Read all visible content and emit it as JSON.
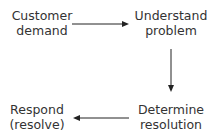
{
  "diagram": {
    "type": "flow-cycle",
    "nodes": [
      {
        "id": "customer-demand",
        "lines": [
          "Customer",
          "demand"
        ]
      },
      {
        "id": "understand-problem",
        "lines": [
          "Understand",
          "problem"
        ]
      },
      {
        "id": "determine-resolution",
        "lines": [
          "Determine",
          "resolution"
        ]
      },
      {
        "id": "respond-resolve",
        "lines": [
          "Respond",
          "(resolve)"
        ]
      }
    ],
    "edges": [
      {
        "from": "customer-demand",
        "to": "understand-problem",
        "direction": "right"
      },
      {
        "from": "understand-problem",
        "to": "determine-resolution",
        "direction": "down"
      },
      {
        "from": "determine-resolution",
        "to": "respond-resolve",
        "direction": "left"
      }
    ],
    "colors": {
      "text": "#333333",
      "arrow": "#222222",
      "background": "#ffffff"
    }
  }
}
